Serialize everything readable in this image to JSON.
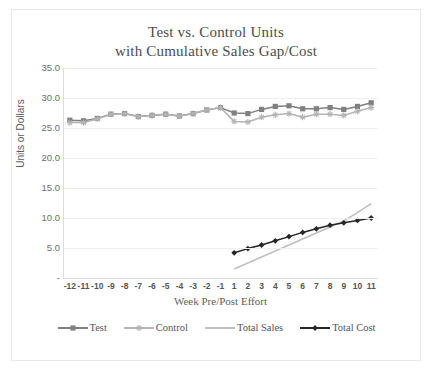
{
  "chart_data": {
    "type": "line",
    "title": "Test vs. Control Units with Cumulative Sales Gap/Cost",
    "title_line1": "Test vs. Control Units",
    "title_line2": "with Cumulative Sales Gap/Cost",
    "xlabel": "Week Pre/Post Effort",
    "ylabel": "Units or Dollars",
    "ylim": [
      0,
      35
    ],
    "ytick_labels": [
      "35.0",
      "30.0",
      "25.0",
      "20.0",
      "15.0",
      "10.0",
      "5.0",
      "-"
    ],
    "ytick_values": [
      35,
      30,
      25,
      20,
      15,
      10,
      5,
      0
    ],
    "grid": "horizontal",
    "legend_position": "bottom",
    "categories": [
      "-12",
      "-11",
      "-10",
      "-9",
      "-8",
      "-7",
      "-6",
      "-5",
      "-4",
      "-3",
      "-2",
      "-1",
      "1",
      "2",
      "3",
      "4",
      "5",
      "6",
      "7",
      "8",
      "9",
      "10",
      "11"
    ],
    "series": [
      {
        "name": "Test",
        "color": "#808080",
        "marker": "square",
        "values": [
          26.3,
          26.2,
          26.6,
          27.3,
          27.4,
          26.9,
          27.1,
          27.3,
          27.0,
          27.4,
          28.0,
          28.4,
          27.5,
          27.4,
          28.1,
          28.6,
          28.7,
          28.2,
          28.2,
          28.4,
          28.1,
          28.6,
          29.2
        ]
      },
      {
        "name": "Control",
        "color": "#b4b4b4",
        "marker": "star",
        "values": [
          25.9,
          25.9,
          26.5,
          27.3,
          27.4,
          26.9,
          27.1,
          27.3,
          27.0,
          27.4,
          28.0,
          28.4,
          26.1,
          26.0,
          26.8,
          27.2,
          27.4,
          26.8,
          27.3,
          27.3,
          27.1,
          27.8,
          28.4
        ]
      },
      {
        "name": "Total Sales",
        "color": "#bfbfbf",
        "marker": "none",
        "values": [
          null,
          null,
          null,
          null,
          null,
          null,
          null,
          null,
          null,
          null,
          null,
          null,
          1.5,
          2.5,
          3.5,
          4.5,
          5.5,
          6.5,
          7.5,
          8.5,
          9.5,
          10.9,
          12.4
        ]
      },
      {
        "name": "Total Cost",
        "color": "#262626",
        "marker": "diamond",
        "values": [
          null,
          null,
          null,
          null,
          null,
          null,
          null,
          null,
          null,
          null,
          null,
          null,
          4.2,
          4.9,
          5.5,
          6.2,
          6.9,
          7.6,
          8.2,
          8.8,
          9.2,
          9.6,
          10.0
        ]
      }
    ]
  },
  "legend": {
    "items": [
      {
        "label": "Test",
        "color": "#808080",
        "marker": "square"
      },
      {
        "label": "Control",
        "color": "#b4b4b4",
        "marker": "star"
      },
      {
        "label": "Total Sales",
        "color": "#bfbfbf",
        "marker": "none"
      },
      {
        "label": "Total Cost",
        "color": "#262626",
        "marker": "diamond"
      }
    ]
  }
}
